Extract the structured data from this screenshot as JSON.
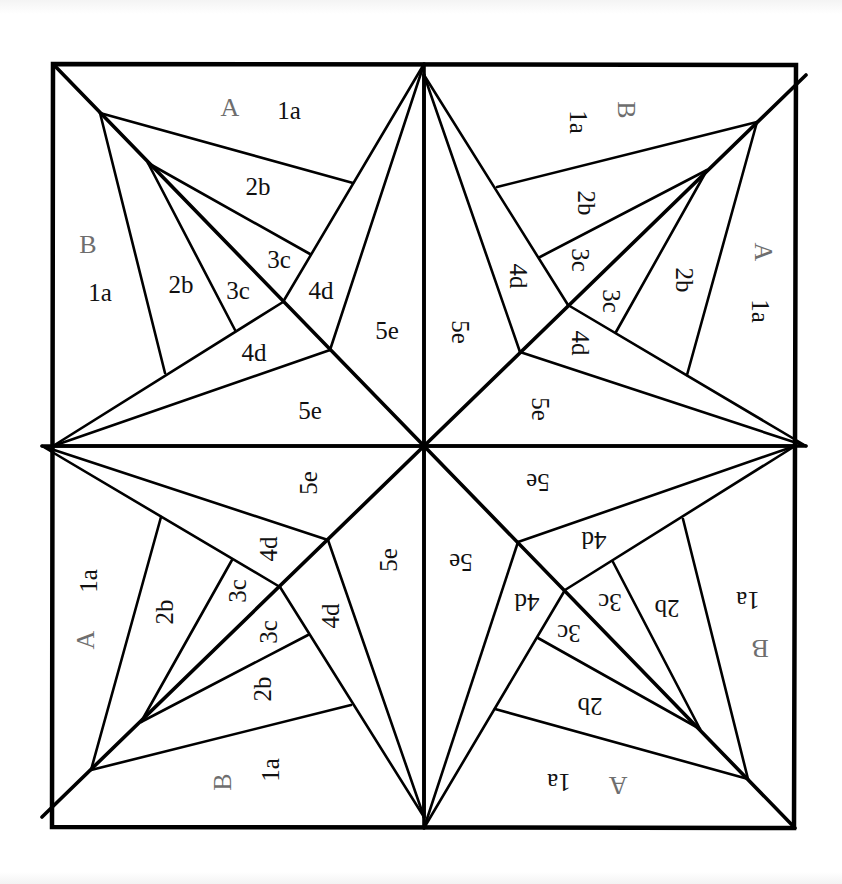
{
  "diagram": {
    "title": "",
    "type": "foundation paper-piecing quilt block pattern",
    "colors": {
      "line": "#000000",
      "background": "#ffffff",
      "piece_label": "#111111",
      "section_label": "#6e6e6e"
    },
    "center": [
      424,
      446
    ],
    "frame": [
      [
        53,
        64
      ],
      [
        796,
        65
      ],
      [
        794,
        828
      ],
      [
        52,
        827
      ]
    ],
    "quadrant_template": {
      "note": "top-left quadrant; other quadrants are the same template rotated 90/180/270 degrees about center",
      "thick_lines": [
        {
          "from": [
            53,
            64
          ],
          "to": [
            424,
            446
          ]
        },
        {
          "from": [
            424,
            64
          ],
          "to": [
            424,
            446
          ]
        },
        {
          "from": [
            53,
            446
          ],
          "to": [
            424,
            446
          ]
        }
      ],
      "thin_lines": [
        {
          "name": "4d-outer-top",
          "from": [
            424,
            64
          ],
          "to": [
            283,
            302
          ]
        },
        {
          "name": "4d-outer-left",
          "from": [
            283,
            302
          ],
          "to": [
            53,
            446
          ]
        },
        {
          "name": "5e-outer-top",
          "from": [
            424,
            64
          ],
          "to": [
            330,
            350
          ]
        },
        {
          "name": "5e-outer-left",
          "from": [
            330,
            350
          ],
          "to": [
            53,
            446
          ]
        },
        {
          "name": "1a-2b-top",
          "from": [
            100,
            113
          ],
          "to": [
            353,
            183
          ]
        },
        {
          "name": "1a-2b-left",
          "from": [
            100,
            113
          ],
          "to": [
            165,
            373
          ]
        },
        {
          "name": "2b-3c-top",
          "from": [
            148,
            163
          ],
          "to": [
            310,
            254
          ]
        },
        {
          "name": "2b-3c-left",
          "from": [
            148,
            163
          ],
          "to": [
            235,
            330
          ]
        }
      ],
      "labels": [
        {
          "text": "A",
          "kind": "letter",
          "pos": [
            230,
            107
          ]
        },
        {
          "text": "1a",
          "kind": "piece",
          "pos": [
            289,
            110
          ]
        },
        {
          "text": "2b",
          "kind": "piece",
          "pos": [
            258,
            186
          ]
        },
        {
          "text": "3c",
          "kind": "piece",
          "pos": [
            279,
            259
          ]
        },
        {
          "text": "4d",
          "kind": "piece",
          "pos": [
            321,
            290
          ]
        },
        {
          "text": "5e",
          "kind": "piece",
          "pos": [
            387,
            330
          ]
        },
        {
          "text": "B",
          "kind": "letter",
          "pos": [
            88,
            244
          ]
        },
        {
          "text": "1a",
          "kind": "piece",
          "pos": [
            100,
            292
          ]
        },
        {
          "text": "2b",
          "kind": "piece",
          "pos": [
            181,
            284
          ]
        },
        {
          "text": "3c",
          "kind": "piece",
          "pos": [
            238,
            290
          ]
        },
        {
          "text": "4d",
          "kind": "piece",
          "pos": [
            254,
            352
          ]
        },
        {
          "text": "5e",
          "kind": "piece",
          "pos": [
            310,
            410
          ]
        }
      ]
    },
    "quadrants": [
      {
        "name": "top-left",
        "rotation": 0
      },
      {
        "name": "top-right",
        "rotation": 90
      },
      {
        "name": "bottom-right",
        "rotation": 180
      },
      {
        "name": "bottom-left",
        "rotation": 270
      }
    ]
  }
}
